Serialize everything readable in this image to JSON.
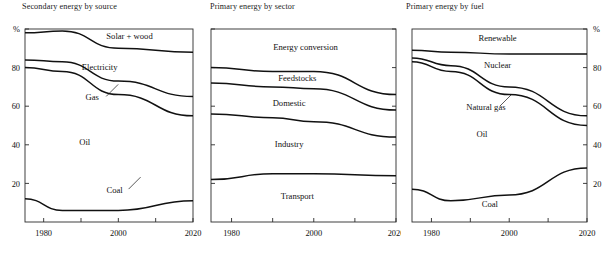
{
  "figure": {
    "width": 613,
    "height": 258,
    "background": "#ffffff",
    "ink": "#111111"
  },
  "chart_data": [
    {
      "type": "area",
      "title": "Secondary energy by source",
      "xlabel": "",
      "ylabel": "%",
      "axis_unit_label": "%",
      "y_axis_side": "left",
      "xlim": [
        1975,
        2020
      ],
      "ylim": [
        0,
        100
      ],
      "xticks": [
        1980,
        1990,
        2000,
        2010,
        2020
      ],
      "xtick_labels": [
        "1980",
        "",
        "2000",
        "",
        "2020"
      ],
      "yticks": [
        20,
        40,
        60,
        80,
        100
      ],
      "ytick_labels": [
        "20",
        "40",
        "60",
        "80",
        "%"
      ],
      "grid": false,
      "legend": "inline-annotations",
      "x": [
        1975,
        1985,
        2000,
        2020
      ],
      "boundaries": [
        {
          "name": "Coal top",
          "values": [
            12,
            6,
            6,
            11
          ]
        },
        {
          "name": "Oil top (Gas bottom)",
          "values": [
            80,
            78,
            66,
            55
          ]
        },
        {
          "name": "Gas top (Electricity bottom)",
          "values": [
            84,
            83,
            73,
            65
          ]
        },
        {
          "name": "Electricity top (Solar + wood bottom)",
          "values": [
            98,
            99,
            90,
            88
          ]
        }
      ],
      "band_labels": [
        {
          "label": "Solar + wood",
          "x": 2003,
          "y": 95,
          "leader": false
        },
        {
          "label": "Electricity",
          "x": 1995,
          "y": 79,
          "leader": false
        },
        {
          "label": "Gas",
          "x": 1993,
          "y": 63,
          "leader": true
        },
        {
          "label": "Oil",
          "x": 1991,
          "y": 40,
          "leader": false
        },
        {
          "label": "Coal",
          "x": 1999,
          "y": 15,
          "leader": true
        }
      ]
    },
    {
      "type": "area",
      "title": "Primary energy by sector",
      "xlabel": "",
      "ylabel": "",
      "y_axis_side": "none",
      "xlim": [
        1975,
        2020
      ],
      "ylim": [
        0,
        100
      ],
      "xticks": [
        1980,
        1990,
        2000,
        2010,
        2020
      ],
      "xtick_labels": [
        "1980",
        "",
        "2000",
        "",
        "2020"
      ],
      "yticks": [
        20,
        40,
        60,
        80,
        100
      ],
      "ytick_labels": [
        "",
        "",
        "",
        "",
        ""
      ],
      "grid": false,
      "legend": "inline-annotations",
      "x": [
        1975,
        1990,
        2000,
        2020
      ],
      "boundaries": [
        {
          "name": "Transport top",
          "values": [
            22,
            25,
            25,
            24
          ]
        },
        {
          "name": "Industry top (Domestic bottom)",
          "values": [
            56,
            54,
            52,
            44
          ]
        },
        {
          "name": "Domestic top (Feedstocks bottom)",
          "values": [
            72,
            70,
            69,
            58
          ]
        },
        {
          "name": "Feedstocks top (Energy conversion bottom)",
          "values": [
            80,
            78,
            78,
            66
          ]
        }
      ],
      "band_labels": [
        {
          "label": "Energy conversion",
          "x": 1998,
          "y": 89,
          "leader": false
        },
        {
          "label": "Feedstocks",
          "x": 1996,
          "y": 73,
          "leader": false
        },
        {
          "label": "Domestic",
          "x": 1994,
          "y": 60,
          "leader": false
        },
        {
          "label": "Industry",
          "x": 1994,
          "y": 39,
          "leader": false
        },
        {
          "label": "Transport",
          "x": 1996,
          "y": 12,
          "leader": false
        }
      ]
    },
    {
      "type": "area",
      "title": "Primary energy by fuel",
      "xlabel": "",
      "ylabel": "%",
      "axis_unit_label": "%",
      "y_axis_side": "right",
      "xlim": [
        1975,
        2020
      ],
      "ylim": [
        0,
        100
      ],
      "xticks": [
        1980,
        1990,
        2000,
        2010,
        2020
      ],
      "xtick_labels": [
        "1980",
        "",
        "2000",
        "",
        "2020"
      ],
      "yticks": [
        20,
        40,
        60,
        80,
        100
      ],
      "ytick_labels": [
        "20",
        "40",
        "60",
        "80",
        "%"
      ],
      "grid": false,
      "legend": "inline-annotations",
      "x": [
        1975,
        1985,
        2000,
        2020
      ],
      "boundaries": [
        {
          "name": "Coal top",
          "values": [
            17,
            11,
            14,
            28
          ]
        },
        {
          "name": "Oil top (Natural gas bottom)",
          "values": [
            83,
            78,
            66,
            50
          ]
        },
        {
          "name": "Natural gas top (Nuclear bottom)",
          "values": [
            85,
            81,
            70,
            55
          ]
        },
        {
          "name": "Nuclear top (Renewable bottom)",
          "values": [
            89,
            88,
            87,
            87
          ]
        }
      ],
      "band_labels": [
        {
          "label": "Renewable",
          "x": 1997,
          "y": 94,
          "leader": false
        },
        {
          "label": "Nuclear",
          "x": 1997,
          "y": 80,
          "leader": false
        },
        {
          "label": "Natural gas",
          "x": 1994,
          "y": 58,
          "leader": true
        },
        {
          "label": "Oil",
          "x": 1993,
          "y": 44,
          "leader": false
        },
        {
          "label": "Coal",
          "x": 1995,
          "y": 8,
          "leader": false
        }
      ]
    }
  ]
}
